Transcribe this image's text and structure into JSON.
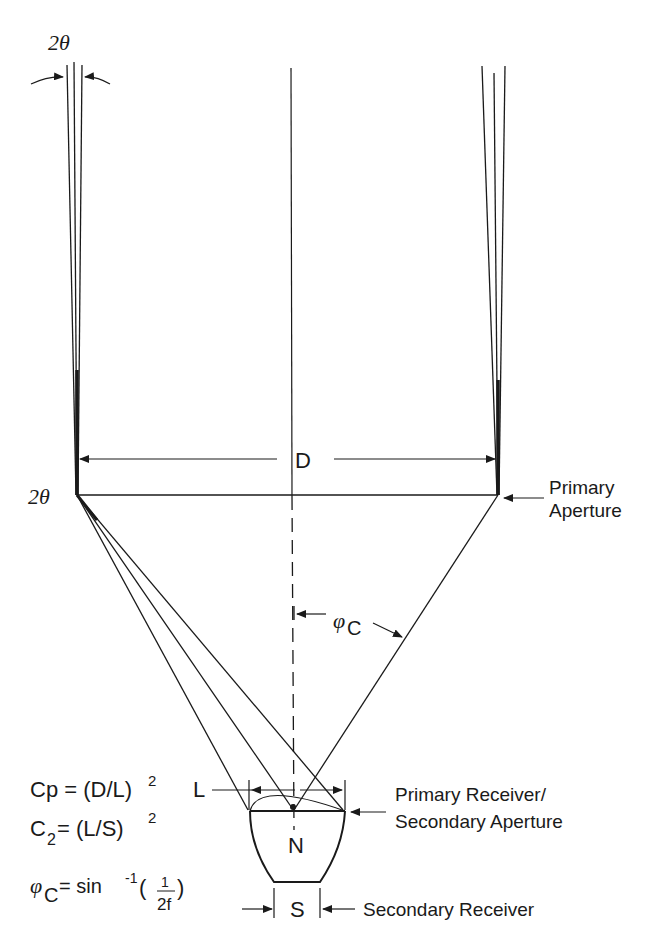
{
  "figure": {
    "type": "optical-concentrator-schematic",
    "labels": {
      "two_theta_top": "2θ",
      "two_theta_left": "2θ",
      "D": "D",
      "phi_c_symbol": "φ",
      "phi_c_sub": "C",
      "L": "L",
      "N": "N",
      "S": "S",
      "primary_aperture_line1": "Primary",
      "primary_aperture_line2": "Aperture",
      "primary_receiver_line1": "Primary Receiver/",
      "primary_receiver_line2": "Secondary Aperture",
      "secondary_receiver": "Secondary Receiver"
    },
    "equations": {
      "cp_lhs": "Cp = (D/L)",
      "cp_exp": "2",
      "c2_c": "C",
      "c2_sub": "2",
      "c2_rhs": " = (L/S)",
      "c2_exp": "2",
      "phi_symbol": "φ",
      "phi_sub": "C",
      "phi_rhs": " = sin",
      "phi_exp": "-1",
      "phi_open": "(",
      "phi_num": "1",
      "phi_den": "2f",
      "phi_close": ")"
    }
  }
}
